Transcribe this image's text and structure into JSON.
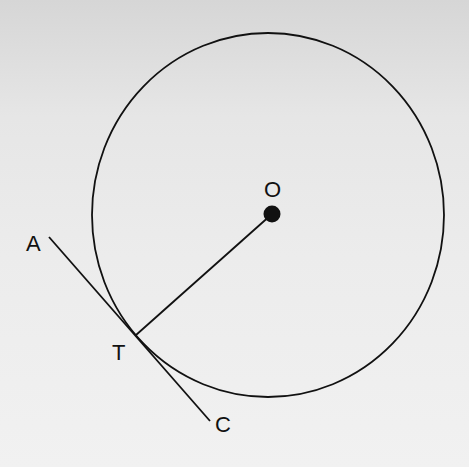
{
  "diagram": {
    "circle": {
      "cx": 268,
      "cy": 215,
      "rx": 176,
      "ry": 182,
      "stroke": "#111111"
    },
    "center": {
      "label": "O",
      "x": 272,
      "y": 214,
      "r": 8
    },
    "tangent_point": {
      "label": "T",
      "x": 136,
      "y": 335
    },
    "tangent_line": {
      "start": {
        "label": "A",
        "x": 49,
        "y": 237
      },
      "end": {
        "label": "C",
        "x": 210,
        "y": 421
      }
    },
    "radius_segment": {
      "from": "O",
      "to": "T"
    },
    "labels": {
      "O": {
        "text": "O",
        "x": 264,
        "y": 197
      },
      "A": {
        "text": "A",
        "x": 26,
        "y": 251
      },
      "T": {
        "text": "T",
        "x": 112,
        "y": 360
      },
      "C": {
        "text": "C",
        "x": 215,
        "y": 432
      }
    }
  }
}
